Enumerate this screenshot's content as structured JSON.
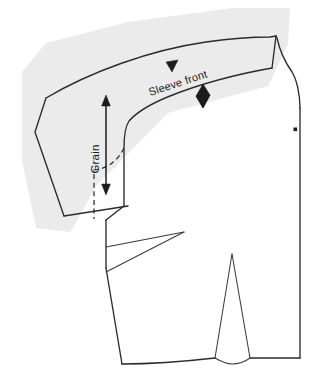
{
  "diagram": {
    "type": "sewing-pattern-draft",
    "canvas": {
      "width": 319,
      "height": 385,
      "background": "#ffffff"
    },
    "colors": {
      "line": "#2b2b2b",
      "thin_line": "#3a3a3a",
      "shadow": "#ebebeb",
      "marker": "#1c1c1c",
      "background": "#ffffff"
    },
    "labels": {
      "sleeve_front": "Sleeve front",
      "grain": "Grain"
    },
    "label_placement": {
      "sleeve_front": {
        "x": 150,
        "y": 96,
        "rotation": -18
      },
      "grain": {
        "x": 99,
        "y": 159,
        "rotation": -90
      }
    },
    "markers": {
      "single_notch": {
        "x": 172,
        "y": 67,
        "label": "single-notch"
      },
      "double_notch": {
        "x": 203,
        "y": 96,
        "label": "double-notch"
      },
      "bust_point_dot": {
        "x": 295,
        "y": 129,
        "label": "bust-point-dot"
      }
    },
    "grain_arrow": {
      "x": 106,
      "y_top": 99,
      "y_bottom": 191,
      "double_headed": true
    },
    "shapes": {
      "shadow_polygon": "M 22,72 L 46,43 L 128,22 L 232,8 L 290,8 L 288,44 L 268,86 L 168,113 L 96,186 L 78,219 L 70,232 L 36,228 L 22,160 Z",
      "sleeve_outline": "M 35,132 L 46,98 C 90,72 150,50 206,42 C 235,38 258,37 270,37 L 276,36 L 272,68 C 238,74 200,84 170,96 C 148,105 136,113 128,122 L 128,206 L 64,216 Z",
      "sleeve_cap_top": "M 46,98 C 90,72 150,50 206,42 C 235,38 258,37 270,37 L 276,36",
      "sleeve_underarm_curve": "M 272,68 C 238,74 200,84 170,96 C 150,104 137,112 129,121 C 125,127 124,137 124,148 L 124,206",
      "sleeve_hem": "M 64,216 L 128,206",
      "bodice_shoulder": "M 276,36 L 277,38 C 280,52 285,62 292,72 C 297,80 300,95 300,108",
      "bodice_center_front": "M 300,108 L 300,358",
      "bodice_hem_right": "M 300,358 L 250,358",
      "bodice_hem_left": "M 215,358 C 180,362 145,364 122,364",
      "bodice_side_seam_upper": "M 106,220 L 106,268",
      "bodice_side_seam_lower": "M 106,268 L 122,364",
      "bodice_underarm": "M 106,220 L 124,206",
      "side_bust_dart_upper": "M 106,247 L 184,232",
      "side_bust_dart_lower": "M 106,272 L 184,232",
      "waist_dart_left_leg": "M 215,358 L 232,254",
      "waist_dart_right_leg": "M 250,358 L 232,254",
      "waist_dart_base_curve": "M 215,358 C 222,362 226,364 232,364 C 240,364 246,361 250,358",
      "dashed_pivot_line": "M 124,148 C 118,160 110,166 100,169 L 94,170 L 94,219"
    }
  }
}
